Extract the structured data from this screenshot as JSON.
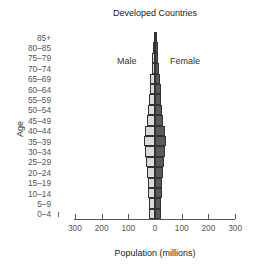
{
  "chart_data": {
    "type": "bar",
    "subtype": "population-pyramid",
    "title": "Developed Countries",
    "xlabel": "Population (millions)",
    "ylabel": "Age",
    "categories": [
      "85+",
      "80–85",
      "75–79",
      "70–74",
      "65–69",
      "60–64",
      "55–59",
      "50–54",
      "45–49",
      "40–44",
      "35–39",
      "30–34",
      "25–29",
      "20–24",
      "15–19",
      "10–14",
      "5–9",
      "0–4"
    ],
    "series": [
      {
        "name": "Male",
        "color": "#d9d9d9",
        "values": [
          4,
          7,
          10,
          13,
          17,
          20,
          22,
          25,
          30,
          37,
          42,
          37,
          33,
          30,
          28,
          26,
          23,
          22
        ]
      },
      {
        "name": "Female",
        "color": "#5a5a5a",
        "values": [
          7,
          10,
          13,
          16,
          19,
          22,
          24,
          26,
          30,
          38,
          43,
          37,
          33,
          30,
          28,
          25,
          22,
          21
        ]
      }
    ],
    "xticks": [
      "300",
      "200",
      "100",
      "0",
      "100",
      "200",
      "300"
    ],
    "xlim": [
      -300,
      300
    ],
    "grid": false,
    "legend": {
      "male_label": "Male",
      "female_label": "Female",
      "position": "inside-top"
    }
  }
}
